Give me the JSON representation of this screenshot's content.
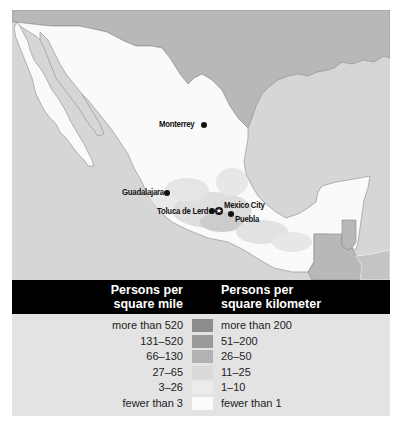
{
  "map": {
    "colors": {
      "ocean": "#d6d6d6",
      "other_land": "#b8b8b8",
      "mexico_land": "#fafafa",
      "coastline": "#8a8a8a"
    },
    "cities": [
      {
        "name": "Monterrey",
        "type": "city"
      },
      {
        "name": "Guadalajara",
        "type": "city"
      },
      {
        "name": "Toluca de Lerdo",
        "type": "city"
      },
      {
        "name": "Mexico City",
        "type": "capital"
      },
      {
        "name": "Puebla",
        "type": "city"
      }
    ],
    "capital_symbol": "★"
  },
  "legend": {
    "header_left": [
      "Persons per",
      "square mile"
    ],
    "header_right": [
      "Persons per",
      "square kilometer"
    ],
    "rows": [
      {
        "per_sq_mile": "more than 520",
        "per_sq_km": "more than 200",
        "color": "#8c8c8c"
      },
      {
        "per_sq_mile": "131–520",
        "per_sq_km": "51–200",
        "color": "#9a9a9a"
      },
      {
        "per_sq_mile": "66–130",
        "per_sq_km": "26–50",
        "color": "#b2b2b2"
      },
      {
        "per_sq_mile": "27–65",
        "per_sq_km": "11–25",
        "color": "#d9d9d9"
      },
      {
        "per_sq_mile": "3–26",
        "per_sq_km": "1–10",
        "color": "#ececec"
      },
      {
        "per_sq_mile": "fewer than 3",
        "per_sq_km": "fewer than 1",
        "color": "#fbfbfb"
      }
    ]
  }
}
